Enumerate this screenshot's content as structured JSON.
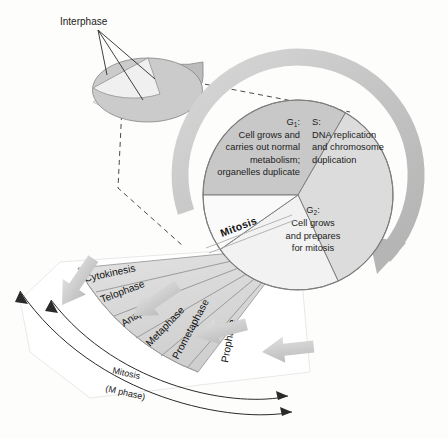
{
  "figure": {
    "type": "cell-cycle-pie-diagram",
    "background_color": "#fdfdfb"
  },
  "inset": {
    "label": "Interphase",
    "description": "Small 3D pie showing interphase as the large gray portion with the mitosis wedge cut away",
    "gray_color": "#c9c9c9",
    "cut_wedge_color": "#ededed",
    "leader_line_count": 3
  },
  "pie": {
    "center_x": 298,
    "center_y": 195,
    "radius": 95,
    "wedges": [
      {
        "id": "g1",
        "name": "G1",
        "heading": "G",
        "subscript": "1",
        "heading_suffix": ":",
        "lines": [
          "Cell grows and",
          "carries out normal",
          "metabolism;",
          "organelles duplicate"
        ],
        "align": "right",
        "color": "#c8c8c8",
        "start_angle": 180,
        "end_angle": 300
      },
      {
        "id": "s",
        "name": "S",
        "heading": "S",
        "subscript": "",
        "heading_suffix": ":",
        "lines": [
          "DNA replication",
          "and chromosome",
          "duplication"
        ],
        "align": "left",
        "color": "#dcdcdc",
        "start_angle": 300,
        "end_angle": 65
      },
      {
        "id": "g2",
        "name": "G2",
        "heading": "G",
        "subscript": "2",
        "heading_suffix": ":",
        "lines": [
          "Cell grows",
          "and prepares",
          "for mitosis"
        ],
        "align": "center",
        "color": "#f2f2f2",
        "start_angle": 65,
        "end_angle": 145
      }
    ],
    "outline_color": "#8a8a8a",
    "cycle_arrow_color": "#c4c4c4"
  },
  "mitosis": {
    "edge_label": "Mitosis",
    "fan_color": "#d5d5d5",
    "fan_divider_color": "#8f8f8f",
    "phases": [
      {
        "label": "Cytokinesis",
        "order": 1
      },
      {
        "label": "Telophase",
        "order": 2
      },
      {
        "label": "Anaphase",
        "order": 3
      },
      {
        "label": "Metaphase",
        "order": 4
      },
      {
        "label": "Prometaphase",
        "order": 5
      },
      {
        "label": "Prophase",
        "order": 6
      }
    ],
    "flow_arrow_color": "#c6c6c6",
    "flow_arrow_count": 4,
    "flow_direction": "right-to-left"
  },
  "bracket": {
    "inner_label": "Mitosis",
    "outer_label": "(M phase)",
    "line_color": "#2a2a2a",
    "arrowheads": "both-ends"
  }
}
